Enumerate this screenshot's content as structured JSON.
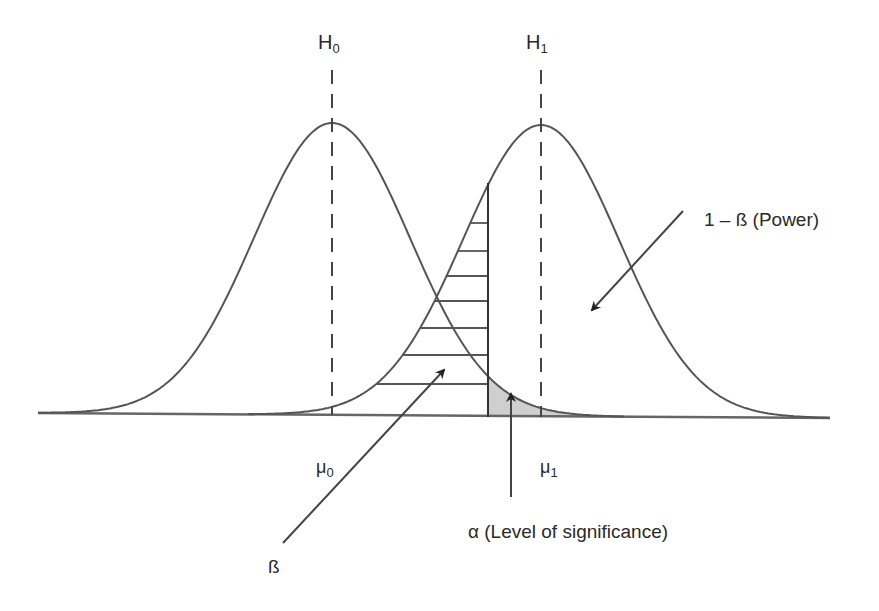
{
  "diagram": {
    "title": "",
    "hypotheses": [
      {
        "label": "H",
        "sub": "0",
        "mean_label": "μ",
        "mean_sub": "0"
      },
      {
        "label": "H",
        "sub": "1",
        "mean_label": "μ",
        "mean_sub": "1"
      }
    ],
    "annotations": {
      "power": "1 – ß (Power)",
      "alpha": "α (Level of significance)",
      "beta": "ß"
    },
    "colors": {
      "curve": "#555555",
      "alpha_region": "#cfcfcf",
      "background": "#ffffff"
    }
  }
}
